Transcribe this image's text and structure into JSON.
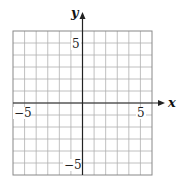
{
  "chart_data": {
    "type": "scatter",
    "title": "",
    "xlabel": "x",
    "ylabel": "y",
    "xlim": [
      -6,
      6
    ],
    "ylim": [
      -6,
      6
    ],
    "grid": true,
    "grid_step": 1,
    "x_ticks_labeled": [
      {
        "value": -5,
        "label": "−5"
      },
      {
        "value": 5,
        "label": "5"
      }
    ],
    "y_ticks_labeled": [
      {
        "value": 5,
        "label": "5"
      },
      {
        "value": -5,
        "label": "−5"
      }
    ],
    "series": [],
    "legend": null
  },
  "colors": {
    "grid": "#b0b0b0",
    "border": "#888888",
    "axis": "#222222",
    "background": "#ffffff"
  },
  "labels": {
    "x_axis": "x",
    "y_axis": "y",
    "x_neg5": "−5",
    "x_pos5": "5",
    "y_pos5": "5",
    "y_neg5": "−5"
  }
}
